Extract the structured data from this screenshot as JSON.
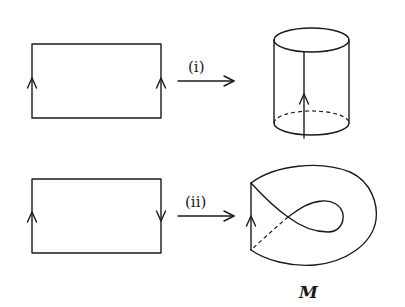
{
  "diagram": {
    "row1": {
      "arrow_label": "(i)",
      "result": "cylinder"
    },
    "row2": {
      "arrow_label": "(ii)",
      "result": "mobius-strip",
      "result_label": "M"
    }
  }
}
